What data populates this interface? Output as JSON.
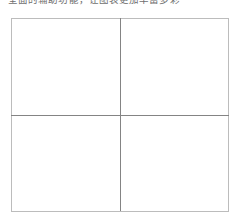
{
  "page": {
    "width": 242,
    "height": 224,
    "background": "#ffffff"
  },
  "caption": {
    "text": "全面的辅助功能，让图表更加丰富多彩",
    "color": "#6f6f6f",
    "clipped_by_top_edge": true
  },
  "table": {
    "rows": 2,
    "columns": 2,
    "outer_border_color": "#bcbcbc",
    "inner_divider_color": "#848484",
    "cell_background": "#ffffff",
    "cells": [
      [
        {
          "text": ""
        },
        {
          "text": ""
        }
      ],
      [
        {
          "text": ""
        },
        {
          "text": ""
        }
      ]
    ]
  }
}
